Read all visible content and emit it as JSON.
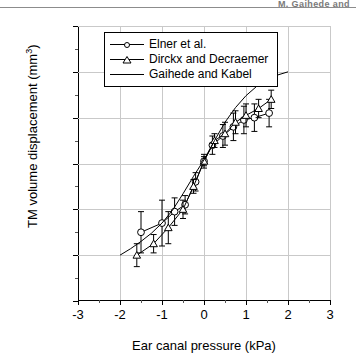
{
  "running_head": "M. Gaihede and",
  "figure": {
    "legend": {
      "items": [
        {
          "label": "Elner et al.",
          "marker": "circle"
        },
        {
          "label": "Dirckx and Decraemer",
          "marker": "triangle"
        },
        {
          "label": "Gaihede and Kabel",
          "marker": "line"
        }
      ]
    }
  },
  "chart_data": {
    "type": "line",
    "title": "",
    "xlabel": "Ear canal pressure (kPa)",
    "ylabel": "TM volume displacement (mm³)",
    "xlim": [
      -3,
      3
    ],
    "ylim": [
      -30,
      30
    ],
    "xticks": [
      -3,
      -2,
      -1,
      0,
      1,
      2,
      3
    ],
    "yticks": [
      -30,
      -20,
      -10,
      0,
      10,
      20,
      30
    ],
    "xtick_labels": [
      "-3",
      "-2",
      "-1",
      "0",
      "1",
      "2",
      "3"
    ],
    "ytick_labels": [
      "-30",
      "-20",
      "-10",
      "0",
      "10",
      "20",
      "30"
    ],
    "x_minor_step": 0.5,
    "y_minor_step": 5,
    "grid": true,
    "grid_color": "#c9c9c9",
    "legend_position": "top-left",
    "series": [
      {
        "name": "Elner et al.",
        "marker": "circle",
        "color": "#000000",
        "x": [
          -1.5,
          -1.0,
          -0.7,
          -0.45,
          -0.2,
          0.0,
          0.2,
          0.45,
          0.7,
          0.95,
          1.2,
          1.55
        ],
        "y": [
          -15.0,
          -13.0,
          -10.5,
          -9.0,
          -4.0,
          0.5,
          4.0,
          6.0,
          8.0,
          9.5,
          10.0,
          11.0
        ],
        "yerr": [
          4.5,
          5.0,
          3.0,
          2.0,
          2.0,
          1.5,
          2.0,
          2.5,
          3.0,
          3.0,
          3.0,
          3.0
        ]
      },
      {
        "name": "Dirckx and Decraemer",
        "marker": "triangle",
        "color": "#000000",
        "x": [
          -1.6,
          -1.2,
          -0.85,
          -0.5,
          -0.25,
          0.0,
          0.25,
          0.5,
          0.75,
          1.0,
          1.3,
          1.6
        ],
        "y": [
          -20.0,
          -17.5,
          -14.0,
          -10.0,
          -5.0,
          0.5,
          5.0,
          6.5,
          9.0,
          10.5,
          12.0,
          14.0
        ],
        "yerr": [
          2.5,
          2.0,
          3.5,
          2.0,
          1.5,
          1.0,
          1.5,
          2.5,
          2.5,
          2.5,
          2.0,
          2.0
        ]
      },
      {
        "name": "Gaihede and Kabel",
        "marker": "line",
        "color": "#000000",
        "x": [
          -2.0,
          -1.75,
          -1.5,
          -1.25,
          -1.0,
          -0.75,
          -0.5,
          -0.25,
          0.0,
          0.25,
          0.5,
          0.75,
          1.0,
          1.25,
          1.5,
          1.75,
          2.0
        ],
        "y": [
          -20.0,
          -18.6,
          -17.0,
          -15.2,
          -13.0,
          -10.2,
          -6.6,
          -2.8,
          0.8,
          5.0,
          9.0,
          12.2,
          14.8,
          16.8,
          18.3,
          19.3,
          20.0
        ]
      }
    ]
  }
}
